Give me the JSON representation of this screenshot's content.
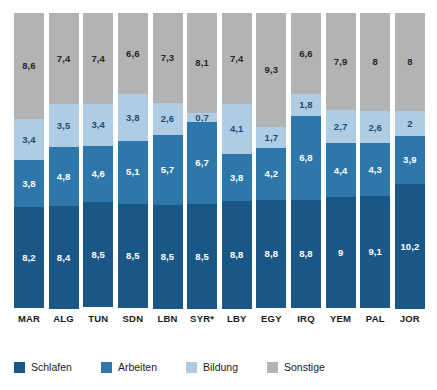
{
  "chart_data": {
    "type": "bar",
    "subtype": "stacked-bar",
    "title": "",
    "subtitle": "",
    "xlabel": "",
    "ylabel": "",
    "ylim": [
      0,
      24
    ],
    "grid": false,
    "legend_position": "bottom-left",
    "stack_total_hours": 24,
    "categories": [
      "MAR",
      "ALG",
      "TUN",
      "SDN",
      "LBN",
      "SYR*",
      "LBY",
      "EGY",
      "IRQ",
      "YEM",
      "PAL",
      "JOR"
    ],
    "series": [
      {
        "name": "Schlafen",
        "color": "#1a5787",
        "values": [
          8.2,
          8.4,
          8.5,
          8.5,
          8.5,
          8.5,
          8.8,
          8.8,
          8.8,
          9,
          9.1,
          10.2
        ],
        "labels": [
          "8,2",
          "8,4",
          "8,5",
          "8,5",
          "8,5",
          "8,5",
          "8,8",
          "8,8",
          "8,8",
          "9",
          "9,1",
          "10,2"
        ]
      },
      {
        "name": "Arbeiten",
        "color": "#2e77aa",
        "values": [
          3.8,
          4.8,
          4.6,
          5.1,
          5.7,
          6.7,
          3.8,
          4.2,
          6.8,
          4.4,
          4.3,
          3.9
        ],
        "labels": [
          "3,8",
          "4,8",
          "4,6",
          "5,1",
          "5,7",
          "6,7",
          "3,8",
          "4,2",
          "6,8",
          "4,4",
          "4,3",
          "3,9"
        ]
      },
      {
        "name": "Bildung",
        "color": "#aecde4",
        "values": [
          3.4,
          3.5,
          3.4,
          3.8,
          2.6,
          0.7,
          4.1,
          1.7,
          1.8,
          2.7,
          2.6,
          2
        ],
        "labels": [
          "3,4",
          "3,5",
          "3,4",
          "3,8",
          "2,6",
          "0,7",
          "4,1",
          "1,7",
          "1,8",
          "2,7",
          "2,6",
          "2"
        ]
      },
      {
        "name": "Sonstige",
        "color": "#b3b3b3",
        "values": [
          8.6,
          7.4,
          7.4,
          6.6,
          7.3,
          8.1,
          7.4,
          9.3,
          6.6,
          7.9,
          8,
          8
        ],
        "labels": [
          "8,6",
          "7,4",
          "7,4",
          "6,6",
          "7,3",
          "8,1",
          "7,4",
          "9,3",
          "6,6",
          "7,9",
          "8",
          "8"
        ]
      }
    ]
  },
  "legend": {
    "items": [
      {
        "label": "Schlafen",
        "color": "#1a5787"
      },
      {
        "label": "Arbeiten",
        "color": "#2e77aa"
      },
      {
        "label": "Bildung",
        "color": "#aecde4"
      },
      {
        "label": "Sonstige",
        "color": "#b3b3b3"
      }
    ]
  }
}
